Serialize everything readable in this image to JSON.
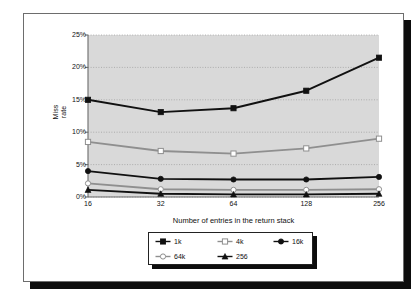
{
  "chart_data": {
    "type": "line",
    "title": "",
    "xlabel": "Number of entries in the return stack",
    "ylabel": "Miss rate",
    "ylabel_line1": "Miss",
    "ylabel_line2": "rate",
    "categories": [
      "16",
      "32",
      "64",
      "128",
      "256"
    ],
    "x_tick_labels": [
      "16",
      "32",
      "64",
      "128",
      "256"
    ],
    "y_tick_labels": [
      "0%",
      "5%",
      "10%",
      "15%",
      "20%",
      "25%"
    ],
    "y_tick_values": [
      0,
      5,
      10,
      15,
      20,
      25
    ],
    "ylim": [
      0,
      25
    ],
    "grid": true,
    "legend_position": "below-plot",
    "series": [
      {
        "name": "1k",
        "color": "#111111",
        "marker": "square-filled",
        "values": [
          15.0,
          13.1,
          13.7,
          16.4,
          21.5
        ]
      },
      {
        "name": "4k",
        "color": "#8f8f8f",
        "marker": "square-open",
        "values": [
          8.5,
          7.1,
          6.7,
          7.5,
          9.0
        ]
      },
      {
        "name": "16k",
        "color": "#111111",
        "marker": "circle-filled",
        "values": [
          4.0,
          2.8,
          2.7,
          2.7,
          3.1
        ]
      },
      {
        "name": "64k",
        "color": "#8f8f8f",
        "marker": "circle-open",
        "values": [
          2.1,
          1.2,
          1.1,
          1.1,
          1.2
        ]
      },
      {
        "name": "256",
        "color": "#111111",
        "marker": "triangle-filled",
        "values": [
          1.1,
          0.5,
          0.4,
          0.4,
          0.5
        ]
      }
    ]
  },
  "legend": {
    "items": [
      {
        "label": "1k"
      },
      {
        "label": "4k"
      },
      {
        "label": "16k"
      },
      {
        "label": "64k"
      },
      {
        "label": "256"
      }
    ]
  },
  "colors": {
    "plot_background": "#d9d9d9",
    "page_background": "#ffffff",
    "shadow": "#0d0d0d",
    "dark_series": "#111111",
    "light_series": "#8f8f8f",
    "gridline": "#9a9a9a",
    "axis": "#6b6b6b"
  }
}
